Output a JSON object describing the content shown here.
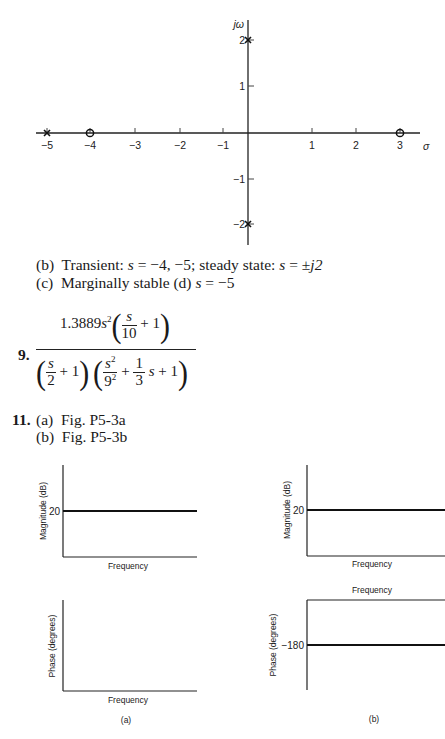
{
  "pole_zero_plot": {
    "axis_labels": {
      "imag": "jω",
      "real": "σ"
    },
    "x_ticks": [
      "−5",
      "−4",
      "−3",
      "−2",
      "−1",
      "1",
      "2",
      "3"
    ],
    "y_ticks": [
      "2",
      "1",
      "−1",
      "−2"
    ],
    "poles": [
      "-5",
      "j2",
      "-j2"
    ],
    "zeros": [
      "-4",
      "3"
    ]
  },
  "answers": {
    "b": {
      "label": "(b)",
      "text_pre": "Transient: ",
      "s": "s",
      "eq1": " = ",
      "vals1": "−4, −5; steady state: ",
      "eq2": " = ",
      "vals2": "±",
      "j2": "j2"
    },
    "c": {
      "label": "(c)",
      "text": "Marginally stable",
      "d_label": "(d)",
      "s": "s",
      "eq": " = ",
      "val": "−5"
    },
    "p9": {
      "number": "9.",
      "num_coef": "1.3889",
      "num_s": "s",
      "num_exp": "2",
      "num_frac_top": "s",
      "num_frac_bot": "10",
      "plus_one": "+ 1",
      "den1_top": "s",
      "den1_bot": "2",
      "den2_top_s": "s",
      "den2_top_exp": "2",
      "den2_bot": "9",
      "den2_bot_exp": "2",
      "plus": "+",
      "den2b_top": "1",
      "den2b_bot": "3",
      "den2_s": "s"
    },
    "p11": {
      "number": "11.",
      "a": "(a)  Fig. P5-3a",
      "b": "(b)  Fig. P5-3b"
    }
  },
  "figures": {
    "a": {
      "caption": "(a)",
      "magnitude": {
        "ylabel": "Magnitude (dB)",
        "xlabel": "Frequency",
        "level_label": "20"
      },
      "phase": {
        "ylabel": "Phase (degrees)",
        "xlabel": "Frequency"
      }
    },
    "b": {
      "caption": "(b)",
      "magnitude": {
        "ylabel": "Magnitude (dB)",
        "xlabel": "Frequency",
        "level_label": "20"
      },
      "phase": {
        "ylabel": "Phase (degrees)",
        "xlabel": "Frequency",
        "level_label": "−180"
      }
    }
  }
}
